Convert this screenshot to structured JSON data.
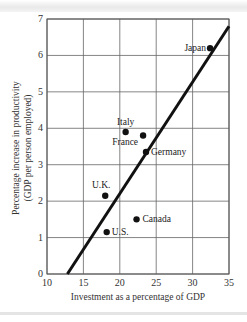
{
  "chart_data": {
    "type": "scatter",
    "title": "",
    "xlabel": "Investment as a percentage of GDP",
    "ylabel": "Percentage increase in productivity",
    "ylabel_line2": "(GDP per person employed)",
    "xlim": [
      10,
      35
    ],
    "ylim": [
      0,
      7
    ],
    "xticks": [
      10,
      15,
      20,
      25,
      30,
      35
    ],
    "yticks": [
      0,
      1,
      2,
      3,
      4,
      5,
      6,
      7
    ],
    "grid": true,
    "legend": null,
    "points": [
      {
        "label": "Japan",
        "x": 32.4,
        "y": 6.2
      },
      {
        "label": "Italy",
        "x": 20.8,
        "y": 3.9
      },
      {
        "label": "France",
        "x": 23.2,
        "y": 3.8
      },
      {
        "label": "Germany",
        "x": 23.6,
        "y": 3.35
      },
      {
        "label": "U.K.",
        "x": 18.0,
        "y": 2.15
      },
      {
        "label": "Canada",
        "x": 22.3,
        "y": 1.5
      },
      {
        "label": "U.S.",
        "x": 18.2,
        "y": 1.15
      }
    ],
    "trend_line": {
      "x1": 12.8,
      "y1": 0,
      "x2": 35,
      "y2": 6.8
    }
  },
  "labels": {
    "xlabel": "Investment as a percentage of GDP",
    "ylabel1": "Percentage increase in productivity",
    "ylabel2": "(GDP per person employed)"
  }
}
